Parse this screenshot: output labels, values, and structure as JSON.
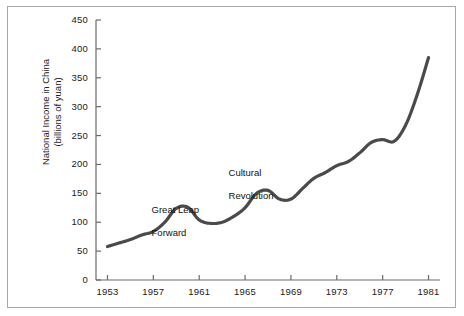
{
  "figure": {
    "border_color": "#a8a8a8",
    "background": "#ffffff",
    "line_color": "#4a4a4a"
  },
  "chart_data": {
    "type": "line",
    "title": "",
    "xlabel": "",
    "ylabel": "National Income in China\n(billions of yuan)",
    "ylabel_line1": "National Income in China",
    "ylabel_line2": "(billions of yuan)",
    "xlim": [
      1952,
      1982
    ],
    "ylim": [
      0,
      450
    ],
    "grid": false,
    "legend": "none",
    "y_ticks": [
      0,
      50,
      100,
      150,
      200,
      250,
      300,
      350,
      400,
      450
    ],
    "y_tick_labels": [
      "0",
      "50",
      "100",
      "150",
      "200",
      "250",
      "300",
      "350",
      "400",
      "450"
    ],
    "x_ticks": [
      1953,
      1957,
      1961,
      1965,
      1969,
      1973,
      1977,
      1981
    ],
    "x_tick_labels": [
      "1953",
      "1957",
      "1961",
      "1965",
      "1969",
      "1973",
      "1977",
      "1981"
    ],
    "x_minor_step": 1,
    "series": [
      {
        "name": "National Income in China",
        "x": [
          1953,
          1954,
          1955,
          1956,
          1957,
          1958,
          1959,
          1960,
          1961,
          1962,
          1963,
          1964,
          1965,
          1966,
          1967,
          1968,
          1969,
          1970,
          1971,
          1972,
          1973,
          1974,
          1975,
          1976,
          1977,
          1978,
          1979,
          1980,
          1981
        ],
        "values": [
          58,
          64,
          70,
          78,
          84,
          100,
          124,
          126,
          104,
          98,
          100,
          110,
          125,
          150,
          155,
          140,
          140,
          158,
          176,
          186,
          198,
          205,
          220,
          238,
          243,
          240,
          268,
          320,
          385
        ]
      }
    ],
    "annotations": [
      {
        "name": "great-leap-forward",
        "line1": "Great Leap",
        "line2": "Forward",
        "x_pixel": 141,
        "y_pixel": 192
      },
      {
        "name": "cultural-revolution",
        "line1": "Cultural",
        "line2": "Revolution",
        "x_pixel": 218,
        "y_pixel": 155
      }
    ]
  }
}
